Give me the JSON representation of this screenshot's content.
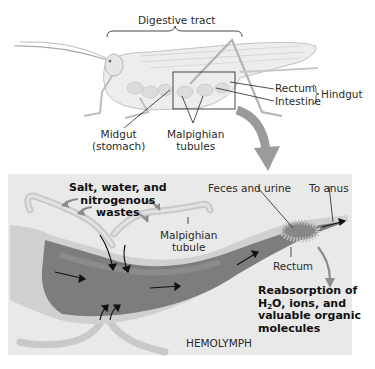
{
  "top_figure": {
    "title": "Digestive tract",
    "labels": {
      "rectum": "Rectum",
      "intestine": "Intestine",
      "hindgut": "Hindgut",
      "midgut_line1": "Midgut",
      "midgut_line2": "(stomach)",
      "malpighian_line1": "Malpighian",
      "malpighian_line2": "tubules"
    }
  },
  "detail_panel": {
    "inputs_label": [
      "Salt, water, and",
      "nitrogenous",
      "wastes"
    ],
    "malpighian_tubule": [
      "Malpighian",
      "tubule"
    ],
    "feces_and_urine": "Feces and urine",
    "to_anus": "To anus",
    "rectum": "Rectum",
    "reabsorption": {
      "line1": "Reabsorption of",
      "line2_pre": "H",
      "line2_sub": "2",
      "line2_post": "O, ions, and",
      "line3": "valuable organic",
      "line4": "molecules"
    },
    "hemolymph": "HEMOLYMPH"
  },
  "colors": {
    "panel_bg": "#e9e9e9",
    "arrow_gray": "#8c8c8c",
    "gut_dark": "#6b6b6b",
    "text": "#222222"
  }
}
